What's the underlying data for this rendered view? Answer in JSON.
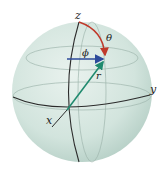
{
  "diagram": {
    "labels": {
      "z_axis": "z",
      "y_axis": "y",
      "x_axis": "x",
      "theta": "θ",
      "phi": "ϕ",
      "r": "r"
    },
    "colors": {
      "sphere_fill": "#d6e6e0",
      "sphere_shade": "#b9d2ca",
      "line": "#2b2b2b",
      "faint_line": "#8fa8a0",
      "theta_arc": "#c0392b",
      "phi_arrow": "#2c4a9a",
      "r_arrow": "#1f8a6e"
    }
  }
}
